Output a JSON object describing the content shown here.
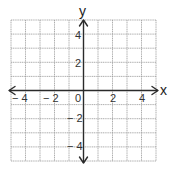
{
  "diagram": {
    "type": "coordinate-plane",
    "x_axis": {
      "label": "x",
      "min": -5,
      "max": 5,
      "tick_labels": [
        {
          "value": -4,
          "text": "− 4"
        },
        {
          "value": -2,
          "text": "− 2"
        },
        {
          "value": 0,
          "text": "0"
        },
        {
          "value": 2,
          "text": "2"
        },
        {
          "value": 4,
          "text": "4"
        }
      ]
    },
    "y_axis": {
      "label": "y",
      "min": -5,
      "max": 5,
      "tick_labels": [
        {
          "value": 4,
          "text": "4"
        },
        {
          "value": 2,
          "text": "2"
        },
        {
          "value": -2,
          "text": "− 2"
        },
        {
          "value": -4,
          "text": "− 4"
        }
      ]
    },
    "grid": {
      "visible": true,
      "step": 1,
      "color": "#9a9a9a"
    },
    "axis_color": "#2a2a2a"
  }
}
